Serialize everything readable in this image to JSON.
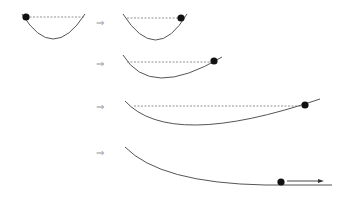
{
  "diagram": {
    "implies_symbol": "⇒",
    "colors": {
      "curve": "#555555",
      "dashed_line": "#777777",
      "ball": "#111111",
      "arrow_symbol": "#999999"
    },
    "stages": [
      {
        "id": 1,
        "curve": "symmetric bowl",
        "ball_position": "left rim",
        "dashed_line": true,
        "velocity_arrow": false
      },
      {
        "id": 2,
        "curve": "symmetric bowl",
        "ball_position": "right rim",
        "dashed_line": true,
        "velocity_arrow": false
      },
      {
        "id": 3,
        "curve": "wider bowl, shallower right slope",
        "ball_position": "right side at initial height",
        "dashed_line": true,
        "velocity_arrow": false
      },
      {
        "id": 4,
        "curve": "very wide bowl, shallow right slope",
        "ball_position": "far right at initial height",
        "dashed_line": true,
        "velocity_arrow": false
      },
      {
        "id": 5,
        "curve": "slope flattening to horizontal",
        "ball_position": "on flat section",
        "dashed_line": false,
        "velocity_arrow": true
      }
    ]
  }
}
